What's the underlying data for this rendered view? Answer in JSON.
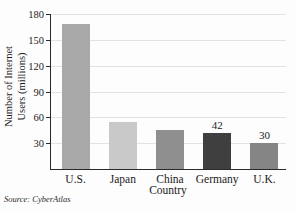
{
  "chart_data": {
    "type": "bar",
    "title": "",
    "xlabel": "Country",
    "ylabel_line1": "Number of Internet",
    "ylabel_line2": "Users (millions)",
    "categories": [
      "U.S.",
      "Japan",
      "China",
      "Germany",
      "U.K."
    ],
    "values": [
      168,
      55,
      45,
      42,
      30
    ],
    "value_labels": [
      "",
      "",
      "",
      "42",
      "30"
    ],
    "bar_colors": [
      "#a8a8a8",
      "#c9c9c9",
      "#8f8f8f",
      "#3f3f3f",
      "#858585"
    ],
    "ylim": [
      0,
      180
    ],
    "yticks": [
      180,
      150,
      120,
      90,
      60,
      30
    ],
    "ytick_labels": [
      "180",
      "150",
      "120",
      "90",
      "60",
      "30"
    ],
    "grid": true,
    "legend": "none",
    "source_label": "Source:",
    "source_name": "CyberAtlas"
  },
  "colors": {
    "axis": "#2a2a2a",
    "grid": "#e2e2e2",
    "text": "#1b1b1b",
    "background": "#fdfdfd"
  }
}
